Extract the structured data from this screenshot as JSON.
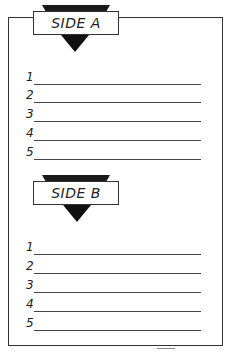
{
  "sections": [
    {
      "title": "SIDE A",
      "lines": [
        "1",
        "2",
        "3",
        "4",
        "5"
      ]
    },
    {
      "title": "SIDE B",
      "lines": [
        "1",
        "2",
        "3",
        "4",
        "5"
      ]
    }
  ]
}
